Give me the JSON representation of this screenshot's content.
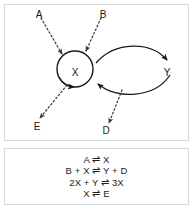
{
  "diagram": {
    "nodes": [
      {
        "id": "X",
        "label": "X",
        "shape": "circle"
      },
      {
        "id": "Y",
        "label": "Y",
        "shape": "plain"
      },
      {
        "id": "A",
        "label": "A",
        "shape": "plain"
      },
      {
        "id": "B",
        "label": "B",
        "shape": "plain"
      },
      {
        "id": "D",
        "label": "D",
        "shape": "plain"
      },
      {
        "id": "E",
        "label": "E",
        "shape": "plain"
      }
    ],
    "edges": [
      {
        "from": "A",
        "to": "X",
        "style": "dotted"
      },
      {
        "from": "B",
        "to": "X",
        "style": "dotted"
      },
      {
        "from": "X",
        "to": "E",
        "style": "dotted"
      },
      {
        "from": "Y-branch",
        "to": "D",
        "style": "dotted"
      },
      {
        "from": "X",
        "to": "Y",
        "style": "solid-curve"
      },
      {
        "from": "Y",
        "to": "X",
        "style": "solid-curve"
      },
      {
        "from": "X",
        "to": "X",
        "style": "solid-selfloop"
      }
    ],
    "stroke_color": "#1a1a1a",
    "dotted_color": "#4a4a4a"
  },
  "equations": {
    "lines": [
      "A ⇌ X",
      "B + X ⇌ Y + D",
      "2X + Y ⇌ 3X",
      "X ⇌ E"
    ]
  }
}
